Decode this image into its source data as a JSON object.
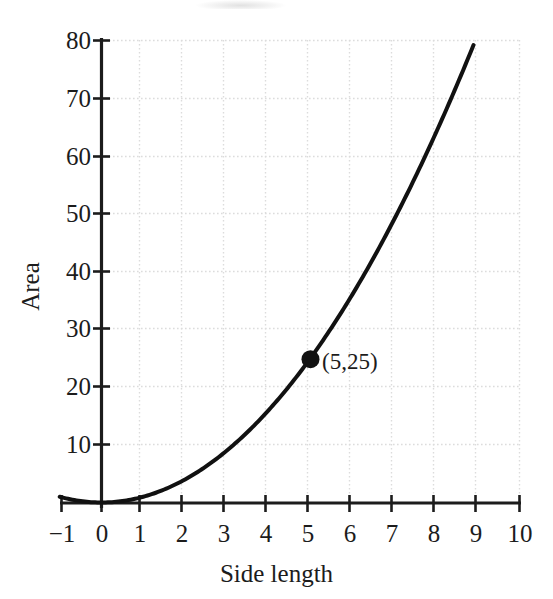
{
  "figure": {
    "background_color": "#ffffff",
    "ink_color": "#1c1c1c"
  },
  "chart_data": {
    "type": "line",
    "title": "",
    "subtitle": "",
    "xlabel": "Side length",
    "ylabel": "Area",
    "xlim": [
      -1,
      10
    ],
    "ylim": [
      0,
      80
    ],
    "xticks": [
      "−1",
      "0",
      "1",
      "2",
      "3",
      "4",
      "5",
      "6",
      "7",
      "8",
      "9",
      "10"
    ],
    "xtick_values": [
      -1,
      0,
      1,
      2,
      3,
      4,
      5,
      6,
      7,
      8,
      9,
      10
    ],
    "yticks": [
      "10",
      "20",
      "30",
      "40",
      "50",
      "60",
      "70",
      "80"
    ],
    "ytick_values": [
      10,
      20,
      30,
      40,
      50,
      60,
      70,
      80
    ],
    "grid": true,
    "grid_style": "dotted",
    "grid_color": "#dcdcdc",
    "legend": false,
    "legend_position": "none",
    "series": [
      {
        "name": "Area = (side length) squared",
        "equation": "y = x^2",
        "color": "#111111",
        "line_width": 4,
        "x": [
          -1,
          -0.5,
          0,
          0.5,
          1,
          1.5,
          2,
          2.5,
          3,
          3.5,
          4,
          4.5,
          5,
          5.5,
          6,
          6.5,
          7,
          7.5,
          8,
          8.5,
          8.95
        ],
        "y": [
          1,
          0.25,
          0,
          0.25,
          1,
          2.25,
          4,
          6.25,
          9,
          12.25,
          16,
          20.25,
          25,
          30.25,
          36,
          42.25,
          49,
          56.25,
          64,
          72.25,
          80
        ]
      }
    ],
    "annotations": [
      {
        "label": "(5,25)",
        "x": 5,
        "y": 25,
        "marker": "filled-circle",
        "marker_color": "#111111",
        "marker_radius": 9
      }
    ]
  }
}
